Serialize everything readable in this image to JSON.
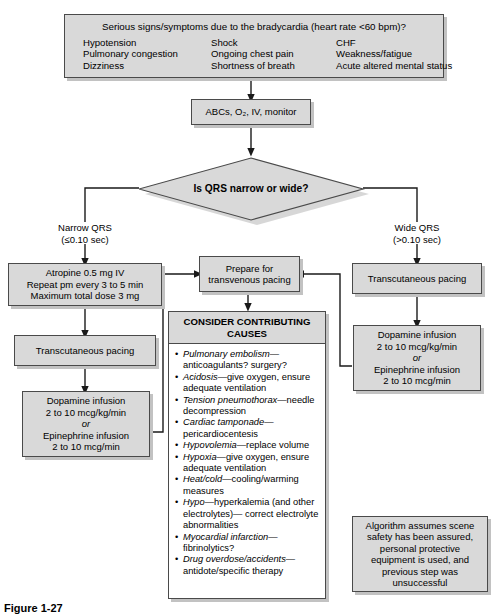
{
  "diagram": {
    "title_caption": "Figure 1-27",
    "top_box": {
      "headline": "Serious signs/symptoms due to the bradycardia (heart rate <60 bpm)?",
      "symptoms": [
        "Hypotension",
        "Shock",
        "CHF",
        "Pulmonary congestion",
        "Ongoing chest pain",
        "Weakness/fatigue",
        "Dizziness",
        "Shortness of breath",
        "Acute altered mental status"
      ]
    },
    "abc_box": {
      "line1": "ABCs, O₂, IV, monitor"
    },
    "decision": {
      "label": "Is QRS narrow or wide?"
    },
    "branch_left": {
      "line1": "Narrow QRS",
      "line2": "(≤0.10 sec)"
    },
    "branch_right": {
      "line1": "Wide QRS",
      "line2": "(>0.10 sec)"
    },
    "atropine_box": {
      "line1": "Atropine 0.5 mg IV",
      "line2": "Repeat pm every 3 to 5 min",
      "line3": "Maximum total dose 3 mg"
    },
    "left_tcp_box": {
      "line1": "Transcutaneous pacing"
    },
    "left_dopamine_box": {
      "line1": "Dopamine infusion",
      "line2": "2 to 10 mcg/kg/min",
      "line3": "or",
      "line4": "Epinephrine infusion",
      "line5": "2 to 10 mcg/min"
    },
    "prepare_box": {
      "line1": "Prepare for",
      "line2": "transvenous pacing"
    },
    "right_tcp_box": {
      "line1": "Transcutaneous pacing"
    },
    "right_dopamine_box": {
      "line1": "Dopamine infusion",
      "line2": "2 to 10 mcg/kg/min",
      "line3": "or",
      "line4": "Epinephrine infusion",
      "line5": "2 to 10 mcg/min"
    },
    "causes_box": {
      "heading_line1": "CONSIDER CONTRIBUTING",
      "heading_line2": "CAUSES",
      "items": [
        {
          "term": "P",
          "term_rest": "ulmonary embolism",
          "rest": "—anticoagulants? surgery?"
        },
        {
          "term": "A",
          "term_rest": "cidosis",
          "rest": "—give oxygen, ensure adequate ventilation"
        },
        {
          "term": "T",
          "term_rest": "ension pneumothorax",
          "rest": "—needle decompression"
        },
        {
          "term": "C",
          "term_rest": "ardiac tamponade",
          "rest": "—pericardiocentesis"
        },
        {
          "term": "H",
          "term_rest": "ypovolemia",
          "rest": "—replace volume"
        },
        {
          "term": "H",
          "term_rest": "ypoxia",
          "rest": "—give oxygen, ensure adequate ventilation"
        },
        {
          "term": "H",
          "term_rest": "eat/cold",
          "rest": "—cooling/warming measures"
        },
        {
          "term": "H",
          "term_rest": "ypo",
          "rest": "—hyperkalemia (and other electrolytes)— correct electrolyte abnormalities"
        },
        {
          "term": "M",
          "term_rest": "yocardial infarction",
          "rest": "—fibrinolytics?"
        },
        {
          "term": "D",
          "term_rest": "rug overdose/accidents",
          "rest": "—antidote/specific therapy"
        }
      ]
    },
    "note_box": {
      "line1": "Algorithm assumes scene",
      "line2": "safety has been assured,",
      "line3": "personal protective",
      "line4": "equipment is used, and",
      "line5": "previous step was",
      "line6": "unsuccessful"
    },
    "colors": {
      "box_fill": "#d9d9d9",
      "box_border": "#4a4a4a",
      "box_shadow": "#c2c2c2",
      "white_fill": "#ffffff",
      "line": "#1a1a1a"
    }
  }
}
